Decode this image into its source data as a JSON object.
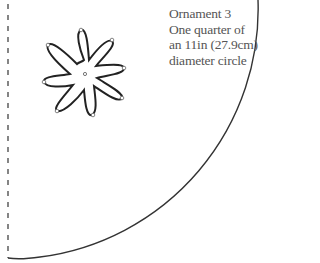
{
  "label": {
    "lines": [
      "Ornament 3",
      "One quarter of",
      "an 11in (27.9cm)",
      "diameter circle"
    ]
  },
  "pattern": {
    "shape": "quarter-circle",
    "edge_style_straight": "dashed",
    "edge_style_curved": "solid",
    "stroke_color": "#333333",
    "motif": "eight-petal-flower",
    "petal_count": 8
  }
}
